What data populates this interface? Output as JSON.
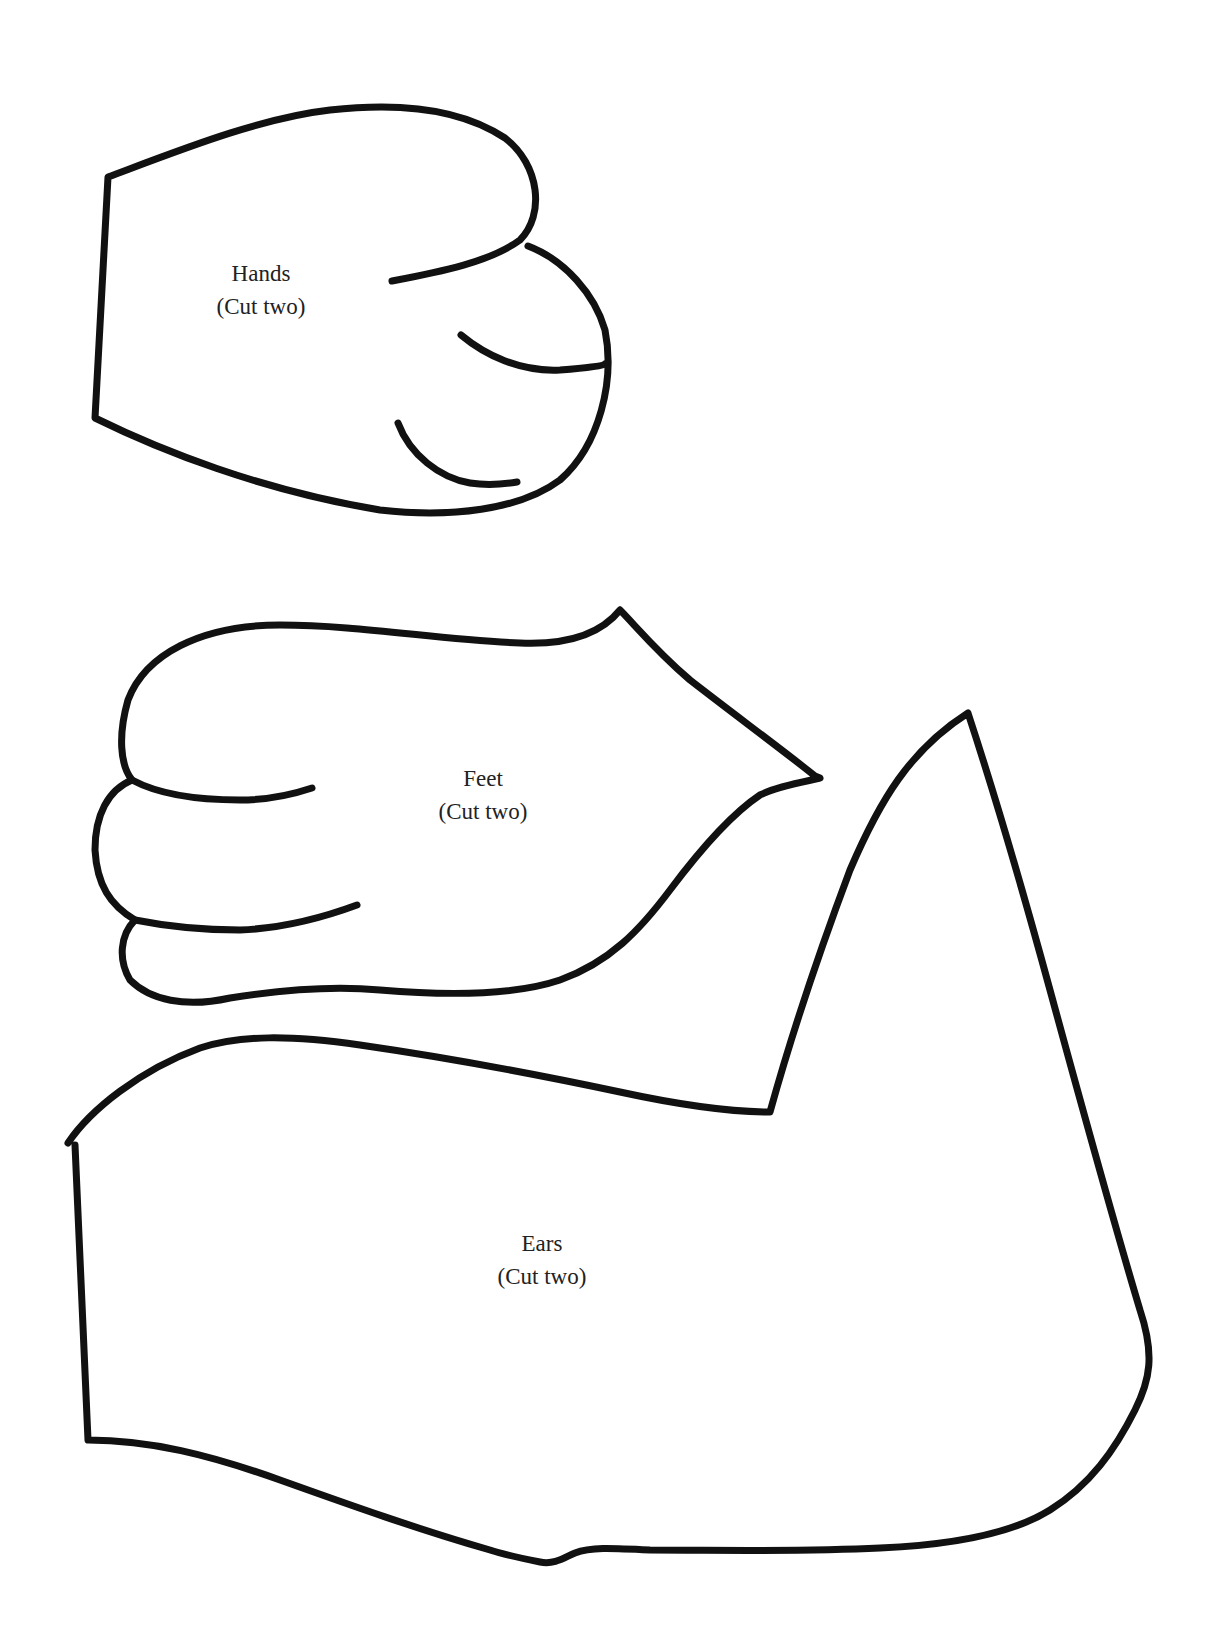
{
  "page": {
    "pieces": [
      {
        "name": "Hands",
        "instruction": "(Cut two)"
      },
      {
        "name": "Feet",
        "instruction": "(Cut two)"
      },
      {
        "name": "Ears",
        "instruction": "(Cut two)"
      }
    ]
  },
  "colors": {
    "outline": "#111111",
    "text": "#222222",
    "background": "#ffffff"
  }
}
